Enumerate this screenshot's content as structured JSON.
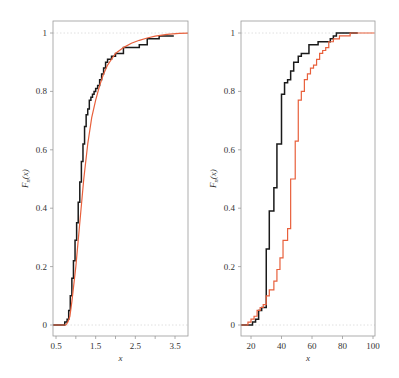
{
  "colors": {
    "empirical": "#1a1a1a",
    "fitted": "#e8603c",
    "frame": "#999999",
    "gridline": "#d8d8d8",
    "text": "#333333"
  },
  "chart_data": [
    {
      "type": "line",
      "title": "",
      "xlabel": "x",
      "ylabel": "F_n(x)",
      "xlim": [
        0.4,
        3.85
      ],
      "ylim": [
        -0.04,
        1.04
      ],
      "xticks": [
        0.5,
        1.5,
        2.5,
        3.5
      ],
      "xtick_labels": [
        "0.5",
        "1.5",
        "2.5",
        "3.5"
      ],
      "yticks": [
        0,
        0.2,
        0.4,
        0.6,
        0.8,
        1
      ],
      "ytick_labels": [
        "0",
        "0.2",
        "0.4",
        "0.6",
        "0.8",
        "1"
      ],
      "reference_lines": [
        0,
        1
      ],
      "grid": false,
      "legend": null,
      "series": [
        {
          "name": "Empirical CDF",
          "style": "step",
          "color": "#1a1a1a",
          "x": [
            0.4,
            0.72,
            0.78,
            0.82,
            0.86,
            0.9,
            0.94,
            0.98,
            1.02,
            1.06,
            1.1,
            1.14,
            1.18,
            1.22,
            1.26,
            1.3,
            1.34,
            1.38,
            1.42,
            1.46,
            1.5,
            1.55,
            1.6,
            1.65,
            1.7,
            1.75,
            1.8,
            1.9,
            2.0,
            2.1,
            2.2,
            2.4,
            2.6,
            2.8,
            3.1,
            3.47
          ],
          "y": [
            0,
            0.01,
            0.02,
            0.05,
            0.1,
            0.16,
            0.22,
            0.29,
            0.35,
            0.42,
            0.49,
            0.56,
            0.62,
            0.68,
            0.72,
            0.74,
            0.77,
            0.78,
            0.79,
            0.8,
            0.81,
            0.82,
            0.84,
            0.86,
            0.88,
            0.9,
            0.91,
            0.92,
            0.93,
            0.93,
            0.95,
            0.95,
            0.96,
            0.98,
            0.99,
            0.99
          ]
        },
        {
          "name": "Fitted CDF",
          "style": "smooth",
          "color": "#e8603c",
          "x": [
            0.4,
            0.75,
            0.8,
            0.85,
            0.9,
            1.0,
            1.1,
            1.2,
            1.3,
            1.4,
            1.5,
            1.6,
            1.7,
            1.8,
            1.9,
            2.0,
            2.2,
            2.4,
            2.6,
            2.8,
            3.0,
            3.3,
            3.6,
            3.85
          ],
          "y": [
            0,
            0.0,
            0.01,
            0.03,
            0.08,
            0.2,
            0.35,
            0.5,
            0.62,
            0.71,
            0.77,
            0.82,
            0.86,
            0.89,
            0.91,
            0.93,
            0.95,
            0.965,
            0.975,
            0.983,
            0.989,
            0.995,
            0.999,
            1.0
          ]
        }
      ],
      "frame_px": {
        "left": 53,
        "top": 21,
        "right": 188,
        "bottom": 336
      },
      "xmap": {
        "x0": 0.5,
        "px0": 56,
        "x1": 3.5,
        "px1": 175
      },
      "ymap": {
        "y0": 0,
        "px0": 325,
        "y1": 1,
        "px1": 33
      }
    },
    {
      "type": "line",
      "title": "",
      "xlabel": "x",
      "ylabel": "F_n(x)",
      "xlim": [
        13,
        101
      ],
      "ylim": [
        -0.04,
        1.04
      ],
      "xticks": [
        20,
        40,
        60,
        80,
        100
      ],
      "xtick_labels": [
        "20",
        "40",
        "60",
        "80",
        "100"
      ],
      "yticks": [
        0,
        0.2,
        0.4,
        0.6,
        0.8,
        1
      ],
      "ytick_labels": [
        "0",
        "0.2",
        "0.4",
        "0.6",
        "0.8",
        "1"
      ],
      "reference_lines": [
        0,
        1
      ],
      "grid": false,
      "legend": null,
      "series": [
        {
          "name": "Empirical CDF (sample 1)",
          "style": "step",
          "color": "#1a1a1a",
          "x": [
            13,
            21,
            23,
            25,
            27,
            30,
            32,
            35,
            37,
            40,
            42,
            44,
            46,
            48,
            51,
            53,
            58,
            64,
            72,
            74,
            76,
            90
          ],
          "y": [
            0,
            0.01,
            0.02,
            0.05,
            0.06,
            0.26,
            0.39,
            0.47,
            0.62,
            0.79,
            0.83,
            0.84,
            0.87,
            0.9,
            0.92,
            0.93,
            0.96,
            0.97,
            0.98,
            0.99,
            1.0,
            1.0
          ]
        },
        {
          "name": "Empirical CDF (sample 2)",
          "style": "step",
          "color": "#e8603c",
          "x": [
            13,
            18,
            20,
            22,
            24,
            26,
            28,
            30,
            32,
            35,
            37,
            39,
            41,
            44,
            46,
            49,
            51,
            53,
            55,
            57,
            59,
            61,
            63,
            65,
            67,
            69,
            71,
            74,
            78,
            85,
            101
          ],
          "y": [
            0,
            0.01,
            0.02,
            0.03,
            0.05,
            0.06,
            0.07,
            0.1,
            0.12,
            0.15,
            0.19,
            0.23,
            0.29,
            0.33,
            0.5,
            0.63,
            0.77,
            0.8,
            0.84,
            0.86,
            0.88,
            0.89,
            0.91,
            0.93,
            0.94,
            0.95,
            0.97,
            0.98,
            0.99,
            1.0,
            1.0
          ]
        }
      ],
      "frame_px": {
        "left": 241,
        "top": 21,
        "right": 375,
        "bottom": 336
      },
      "xmap": {
        "x0": 20,
        "px0": 251,
        "x1": 100,
        "px1": 373
      },
      "ymap": {
        "y0": 0,
        "px0": 325,
        "y1": 1,
        "px1": 33
      }
    }
  ]
}
